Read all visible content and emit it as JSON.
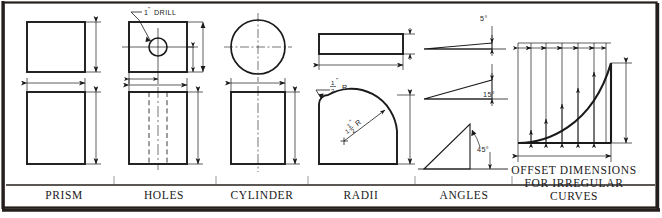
{
  "plate": {
    "title": "Dimensioning conventions reference plate",
    "background": "#ffffff",
    "ink": "#1a1a1a",
    "frame_color": "#241f1c",
    "width": 662,
    "height": 218
  },
  "captions": [
    {
      "id": "prism",
      "label": "PRISM"
    },
    {
      "id": "holes",
      "label": "HOLES"
    },
    {
      "id": "cylinder",
      "label": "CYLINDER"
    },
    {
      "id": "radii",
      "label": "RADII"
    },
    {
      "id": "angles",
      "label": "ANGLES"
    },
    {
      "id": "offset",
      "label_line1": "OFFSET  DIMENSIONS",
      "label_line2": "FOR IRREGULAR",
      "label_line3": "CURVES"
    }
  ],
  "annotations": {
    "drill_note": "1\" DRILL",
    "drill_note_value": "1",
    "drill_note_unit": "\"",
    "drill_note_word": "DRILL",
    "fillet_radius_num": "1",
    "fillet_radius_den": "2",
    "fillet_radius_unit": "\"",
    "fillet_radius_letter": "R",
    "corner_radius_whole": "1",
    "corner_radius_num": "1",
    "corner_radius_den": "2",
    "corner_radius_unit": "\"",
    "corner_radius_letter": "R"
  },
  "angles": [
    {
      "id": "angle-5",
      "label": "5°",
      "degrees": 5
    },
    {
      "id": "angle-15",
      "label": "15°",
      "degrees": 15
    },
    {
      "id": "angle-45",
      "label": "45°",
      "degrees": 45
    }
  ],
  "offset_curve": {
    "ordinate_count": 6,
    "description": "irregular curve dimensioned by equal horizontal spacings with vertical offsets"
  }
}
